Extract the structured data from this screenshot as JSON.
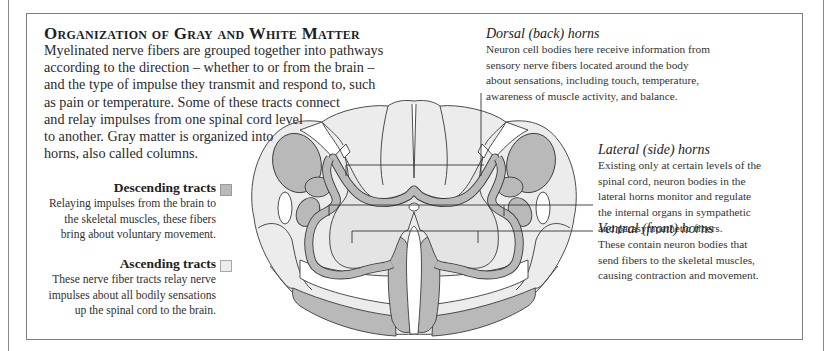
{
  "title": "Organization of Gray and White Matter",
  "intro_lines": [
    "Myelinated nerve fibers are grouped together into pathways",
    "according to the direction – whether to or from the brain –",
    "and the type of impulse they transmit and respond to, such",
    "as pain or temperature. Some of these tracts connect",
    "and relay impulses from one spinal cord level",
    "to another. Gray matter is organized into",
    "horns, also called columns."
  ],
  "legend": {
    "descending": {
      "title": "Descending tracts",
      "color": "#b9b9b9",
      "lines": [
        "Relaying impulses from the brain to",
        "the skeletal muscles, these fibers",
        "bring about voluntary movement."
      ]
    },
    "ascending": {
      "title": "Ascending tracts",
      "color": "#ececec",
      "lines": [
        "These nerve fiber tracts relay nerve",
        "impulses about all bodily sensations",
        "up the spinal cord to the brain."
      ]
    }
  },
  "notes": {
    "dorsal": {
      "title": "Dorsal (back) horns",
      "lines": [
        "Neuron cell bodies here receive information from",
        "sensory nerve fibers located around the body",
        "about sensations, including touch, temperature,",
        "awareness of muscle activity, and balance."
      ]
    },
    "lateral": {
      "title": "Lateral (side) horns",
      "lines": [
        "Existing only at certain levels of the",
        "spinal cord, neuron bodies in the",
        "lateral horns monitor and regulate",
        "the internal organs in sympathetic",
        "and parasympathetic fibers."
      ]
    },
    "ventral": {
      "title": "Ventral (front) horns",
      "lines": [
        "These contain neuron bodies that",
        "send fibers to the skeletal muscles,",
        "causing contraction and movement."
      ]
    }
  },
  "colors": {
    "descending_fill": "#b9b9b9",
    "ascending_fill": "#ececec",
    "gray_matter_fill": "#e4e4e4",
    "outline": "#3a3a3a"
  }
}
